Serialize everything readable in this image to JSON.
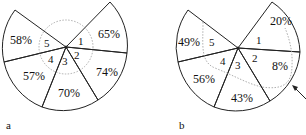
{
  "panels": [
    {
      "id": "a",
      "label": "a",
      "sectors": [
        {
          "index": "1",
          "value": "65%"
        },
        {
          "index": "2",
          "value": "74%"
        },
        {
          "index": "3",
          "value": "70%"
        },
        {
          "index": "4",
          "value": "57%"
        },
        {
          "index": "5",
          "value": "58%"
        }
      ],
      "inner_path": "dotted circle around center"
    },
    {
      "id": "b",
      "label": "b",
      "sectors": [
        {
          "index": "1",
          "value": "20%"
        },
        {
          "index": "2",
          "value": "8%"
        },
        {
          "index": "3",
          "value": "43%"
        },
        {
          "index": "4",
          "value": "56%"
        },
        {
          "index": "5",
          "value": "49%"
        }
      ],
      "inner_path": "dotted curve with arrow pointer"
    }
  ],
  "colors": {
    "line": "#222222",
    "dotted": "#999999",
    "background": "#ffffff"
  }
}
